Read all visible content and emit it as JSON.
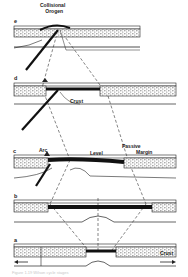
{
  "figure": {
    "title_label": "Collisional Orogen",
    "stages": [
      {
        "id": "e",
        "label": "e"
      },
      {
        "id": "d",
        "label": "d"
      },
      {
        "id": "c",
        "label": "c"
      },
      {
        "id": "b",
        "label": "b"
      },
      {
        "id": "a",
        "label": "a"
      }
    ],
    "annotations": {
      "collisional_line1": "Collisional",
      "collisional_line2": "Orogen",
      "crust_d": "Crust",
      "arc": "Arc",
      "level": "Level",
      "passive_line1": "Passive",
      "passive_line2": "Margin",
      "crust_a": "Crust"
    },
    "caption": "Figure 1.19 Wilson cycle stages",
    "colors": {
      "ink": "#1a1a1a",
      "paper": "#ffffff",
      "stipple": "#9a9a9a"
    }
  }
}
